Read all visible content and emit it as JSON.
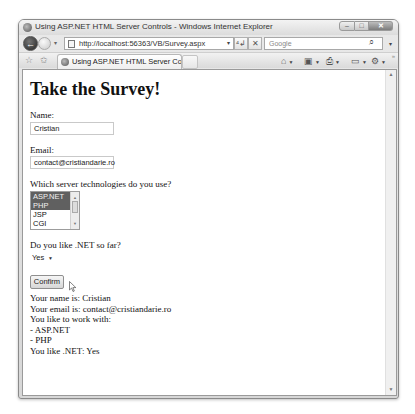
{
  "window": {
    "title": "Using ASP.NET HTML Server Controls - Windows Internet Explorer",
    "controls": {
      "minimize": "–",
      "maximize": "□",
      "close": "✕"
    }
  },
  "navbar": {
    "back_icon": "←",
    "dropdown_icon": "▾",
    "address": "http://localhost:56363/VB/Survey.aspx",
    "refresh_icon": "⁴↲",
    "stop_icon": "✕",
    "search_placeholder": "Google",
    "search_icon": "⌕"
  },
  "tabbar": {
    "favorites_icon": "☆",
    "add_favorites_icon": "✩",
    "tab_label": "Using ASP.NET HTML Server Controls",
    "commands": [
      {
        "name": "home",
        "glyph": "⌂"
      },
      {
        "name": "feeds",
        "glyph": "▣"
      },
      {
        "name": "print",
        "glyph": "⎙"
      },
      {
        "name": "page",
        "glyph": "▭"
      },
      {
        "name": "tools",
        "glyph": "⚙"
      }
    ]
  },
  "page": {
    "heading": "Take the Survey!",
    "name_label": "Name:",
    "name_value": "Cristian",
    "email_label": "Email:",
    "email_value": "contact@cristiandarie.ro",
    "tech_label": "Which server technologies do you use?",
    "tech_options": [
      {
        "label": "ASP.NET",
        "selected": true
      },
      {
        "label": "PHP",
        "selected": true
      },
      {
        "label": "JSP",
        "selected": false
      },
      {
        "label": "CGI",
        "selected": false
      }
    ],
    "likes_label": "Do you like .NET so far?",
    "likes_value": "Yes",
    "confirm_label": "Confirm",
    "results": [
      "Your name is: Cristian",
      "Your email is: contact@cristiandarie.ro",
      "You like to work with:",
      "- ASP.NET",
      "- PHP",
      "You like .NET: Yes"
    ]
  }
}
